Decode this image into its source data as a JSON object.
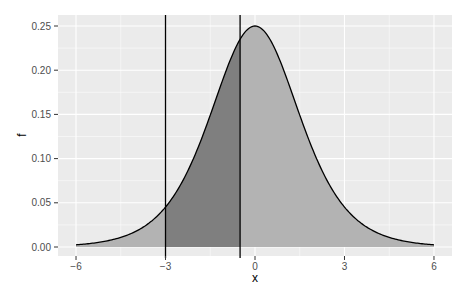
{
  "chart_data": {
    "type": "area",
    "title": "",
    "xlabel": "x",
    "ylabel": "f",
    "xlim": [
      -6.6,
      6.6
    ],
    "ylim": [
      -0.0125,
      0.2625
    ],
    "x_ticks": [
      -6,
      -3,
      0,
      3,
      6
    ],
    "x_tick_labels": [
      "−6",
      "−3",
      "0",
      "3",
      "6"
    ],
    "y_ticks": [
      0.0,
      0.05,
      0.1,
      0.15,
      0.2,
      0.25
    ],
    "y_tick_labels": [
      "0.00",
      "0.05",
      "0.10",
      "0.15",
      "0.20",
      "0.25"
    ],
    "grid": true,
    "distribution": "logistic density f(x) = e^-x / (1 + e^-x)^2",
    "curve": {
      "x": [
        -6,
        -5,
        -4,
        -3,
        -2,
        -1.5,
        -1,
        -0.5,
        0,
        0.5,
        1,
        1.5,
        2,
        3,
        4,
        5,
        6
      ],
      "y": [
        0.0025,
        0.0066,
        0.0177,
        0.0452,
        0.105,
        0.149,
        0.197,
        0.235,
        0.25,
        0.235,
        0.197,
        0.149,
        0.105,
        0.0452,
        0.0177,
        0.0066,
        0.0025
      ]
    },
    "shaded_region": {
      "from": -3,
      "to": -0.5,
      "fill": "#7f7f7f"
    },
    "background_fill": {
      "from": -6,
      "to": 6,
      "fill": "#b3b3b3"
    },
    "vertical_lines": [
      -3,
      -0.5
    ],
    "colors": {
      "panel": "#ebebeb",
      "grid": "#ffffff",
      "curve": "#000000",
      "light_fill": "#b3b3b3",
      "dark_fill": "#7f7f7f"
    }
  }
}
